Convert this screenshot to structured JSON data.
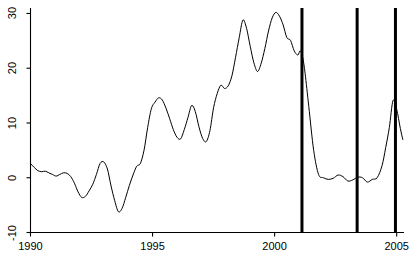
{
  "chart_data": {
    "type": "line",
    "title": "",
    "xlabel": "",
    "ylabel": "",
    "xlim": [
      1990.0,
      2005.3
    ],
    "ylim": [
      -10,
      31
    ],
    "xticks": [
      1990,
      1995,
      2000,
      2005
    ],
    "xtick_labels": [
      "1990",
      "1995",
      "2000",
      "2005"
    ],
    "yticks": [
      -10,
      0,
      10,
      20,
      30
    ],
    "ytick_labels": [
      "-10",
      "0",
      "10",
      "20",
      "30"
    ],
    "grid": false,
    "legend": null,
    "line_color": "#000000",
    "line_width": 1.0,
    "axis_color": "#000000",
    "vline_color": "#000000",
    "vline_width": 3.0,
    "vlines": [
      2001.12,
      2003.38,
      2004.95
    ],
    "series": [
      {
        "name": "series-1",
        "x": [
          1990.0,
          1990.15,
          1990.3,
          1990.45,
          1990.6,
          1990.75,
          1990.9,
          1991.05,
          1991.2,
          1991.35,
          1991.5,
          1991.65,
          1991.8,
          1991.95,
          1992.1,
          1992.25,
          1992.4,
          1992.55,
          1992.7,
          1992.85,
          1993.0,
          1993.15,
          1993.3,
          1993.45,
          1993.6,
          1993.75,
          1993.9,
          1994.05,
          1994.2,
          1994.35,
          1994.5,
          1994.65,
          1994.8,
          1994.95,
          1995.1,
          1995.25,
          1995.4,
          1995.55,
          1995.7,
          1995.85,
          1996.0,
          1996.15,
          1996.3,
          1996.45,
          1996.6,
          1996.75,
          1996.9,
          1997.05,
          1997.2,
          1997.35,
          1997.5,
          1997.65,
          1997.8,
          1997.95,
          1998.1,
          1998.25,
          1998.4,
          1998.55,
          1998.7,
          1998.85,
          1999.0,
          1999.15,
          1999.3,
          1999.45,
          1999.6,
          1999.75,
          1999.9,
          2000.05,
          2000.2,
          2000.35,
          2000.5,
          2000.65,
          2000.8,
          2000.95,
          2001.05,
          2001.15,
          2001.25,
          2001.4,
          2001.6,
          2001.8,
          2002.0,
          2002.2,
          2002.4,
          2002.6,
          2002.8,
          2003.0,
          2003.2,
          2003.4,
          2003.6,
          2003.8,
          2004.0,
          2004.2,
          2004.4,
          2004.55,
          2004.7,
          2004.85,
          2005.0,
          2005.15,
          2005.25
        ],
        "y": [
          2.6,
          1.9,
          1.3,
          1.1,
          1.2,
          0.9,
          0.6,
          0.3,
          0.6,
          0.9,
          0.8,
          0.2,
          -1.0,
          -2.6,
          -3.6,
          -3.4,
          -2.4,
          -1.2,
          0.6,
          2.6,
          2.9,
          1.6,
          -1.5,
          -4.2,
          -6.2,
          -5.6,
          -3.6,
          -1.4,
          0.5,
          2.1,
          2.6,
          5.0,
          9.2,
          12.6,
          13.8,
          14.6,
          14.2,
          12.7,
          10.8,
          8.8,
          7.4,
          7.1,
          8.8,
          11.0,
          13.2,
          12.1,
          9.3,
          7.2,
          6.6,
          8.6,
          12.8,
          15.4,
          16.9,
          16.3,
          16.8,
          18.6,
          22.0,
          25.6,
          28.8,
          27.3,
          24.0,
          21.0,
          19.4,
          20.9,
          23.6,
          26.8,
          29.2,
          30.2,
          29.5,
          27.9,
          25.6,
          25.1,
          23.2,
          22.4,
          23.2,
          22.0,
          19.0,
          13.0,
          5.0,
          0.6,
          0.0,
          -0.3,
          -0.1,
          0.5,
          0.2,
          -0.6,
          -0.4,
          0.1,
          0.0,
          -0.8,
          -0.3,
          0.0,
          2.2,
          5.5,
          9.2,
          14.1,
          12.5,
          9.0,
          7.0
        ]
      }
    ]
  },
  "axes": {
    "ytick_labels": [
      "30",
      "20",
      "10",
      "0",
      "-10"
    ],
    "xtick_labels": [
      "1990",
      "1995",
      "2000",
      "2005"
    ]
  }
}
